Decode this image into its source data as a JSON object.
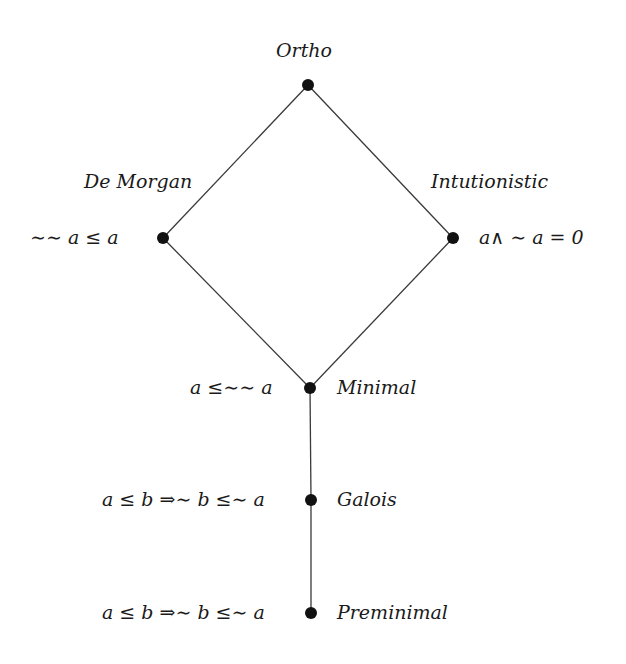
{
  "diagram": {
    "nodes": [
      {
        "id": "ortho",
        "name": "Ortho",
        "x": 308,
        "y": 85
      },
      {
        "id": "de-morgan",
        "name": "De Morgan",
        "condition": "∼∼ a ≤ a",
        "x": 163,
        "y": 238
      },
      {
        "id": "intuitionistic",
        "name": "Intutionistic",
        "condition": "a∧ ∼ a = 0",
        "x": 453,
        "y": 238
      },
      {
        "id": "minimal",
        "name": "Minimal",
        "condition": "a ≤∼∼ a",
        "x": 310,
        "y": 388
      },
      {
        "id": "galois",
        "name": "Galois",
        "condition": "a ≤ b ⇒∼ b ≤∼ a",
        "x": 311,
        "y": 500
      },
      {
        "id": "preminimal",
        "name": "Preminimal",
        "condition": "a ≤ b ⇒∼ b ≤∼ a",
        "x": 311,
        "y": 613
      }
    ],
    "edges": [
      [
        "ortho",
        "de-morgan"
      ],
      [
        "ortho",
        "intuitionistic"
      ],
      [
        "de-morgan",
        "minimal"
      ],
      [
        "intuitionistic",
        "minimal"
      ],
      [
        "minimal",
        "galois"
      ],
      [
        "galois",
        "preminimal"
      ]
    ],
    "colors": {
      "line": "#3a3a3a",
      "node": "#111111",
      "background": "#ffffff"
    }
  }
}
